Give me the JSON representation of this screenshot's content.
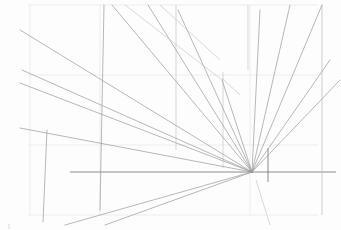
{
  "image": {
    "subject": "pencil sketch of one-point perspective construction lines",
    "background": "#fdfdfd",
    "stroke_color": "#9a9a9a",
    "vanishing_point": {
      "x": 252,
      "y": 172
    },
    "horizon_y": 172
  }
}
